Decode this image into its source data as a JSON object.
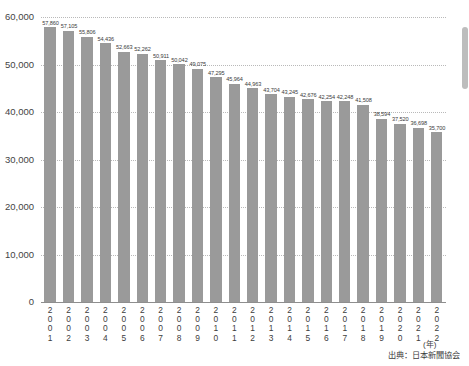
{
  "chart_data": {
    "type": "bar",
    "title": "",
    "xlabel": "(年)",
    "ylabel": "",
    "ylim": [
      0,
      60000
    ],
    "ytick_labels": [
      "60,000",
      "50,000",
      "40,000",
      "30,000",
      "20,000",
      "10,000",
      "0"
    ],
    "ytick_values": [
      60000,
      50000,
      40000,
      30000,
      20000,
      10000,
      0
    ],
    "grid": true,
    "legend": "none",
    "bar_color": "#9a9a9a",
    "categories": [
      "2001",
      "2002",
      "2003",
      "2004",
      "2005",
      "2006",
      "2007",
      "2008",
      "2009",
      "2010",
      "2011",
      "2012",
      "2013",
      "2014",
      "2015",
      "2016",
      "2017",
      "2018",
      "2019",
      "2020",
      "2021",
      "2022"
    ],
    "values": [
      57860,
      57105,
      55806,
      54436,
      52663,
      52262,
      50911,
      50042,
      49075,
      47295,
      45964,
      44963,
      43704,
      43245,
      42676,
      42254,
      42248,
      41508,
      38594,
      37520,
      36698,
      35700
    ],
    "value_labels": [
      "57,860",
      "57,105",
      "55,806",
      "54,436",
      "52,663",
      "52,262",
      "50,911",
      "50,042",
      "49,075",
      "47,295",
      "45,964",
      "44,963",
      "43,704",
      "43,245",
      "42,676",
      "42,254",
      "42,248",
      "41,508",
      "38,594",
      "37,520",
      "36,698",
      "35,700"
    ]
  },
  "footer": {
    "source": "出典：日本新聞協会",
    "axis_unit": "(年)"
  }
}
